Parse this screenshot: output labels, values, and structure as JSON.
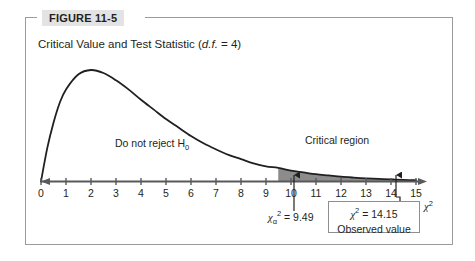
{
  "figure": {
    "tag_label": "FIGURE 11-5",
    "caption_prefix": "Critical Value and Test Statistic (",
    "caption_italic": "d.f.",
    "caption_suffix": " = 4)"
  },
  "labels": {
    "do_not_reject": "Do not reject H",
    "do_not_reject_sub": "0",
    "critical_region": "Critical region",
    "axis_title_base": "χ",
    "axis_title_sup": "2",
    "critical_value_base": "χ",
    "critical_value_sub": "α",
    "critical_value_sup": "2",
    "critical_value_text": " = 9.49",
    "observed_base": "χ",
    "observed_sup": "2",
    "observed_text": " = 14.15",
    "observed_caption": "Observed value"
  },
  "colors": {
    "curve": "#231f20",
    "axis": "#58595b",
    "shade_fill": "#8c8c8c",
    "frame": "#9b9b9b",
    "tag_bg": "#e3e3e3",
    "text": "#231f20",
    "box_border": "#8e8e8e"
  },
  "chart_data": {
    "type": "area",
    "title": "Critical Value and Test Statistic (d.f. = 4)",
    "xlabel": "χ²",
    "ylabel": "",
    "xlim": [
      0,
      15
    ],
    "ylim": [
      0,
      1
    ],
    "grid": false,
    "legend": "none",
    "distribution": "chi-square",
    "degrees_of_freedom": 4,
    "tick_labels": [
      "0",
      "1",
      "2",
      "3",
      "4",
      "5",
      "6",
      "7",
      "8",
      "9",
      "10",
      "11",
      "12",
      "13",
      "14",
      "15"
    ],
    "x": [
      0,
      0.25,
      0.5,
      0.75,
      1,
      1.5,
      2,
      2.5,
      3,
      3.5,
      4,
      4.5,
      5,
      5.5,
      6,
      6.5,
      7,
      7.5,
      8,
      8.5,
      9,
      9.49,
      10,
      10.5,
      11,
      11.5,
      12,
      12.5,
      13,
      13.5,
      14,
      14.15,
      14.5,
      15
    ],
    "y": [
      0,
      0.055,
      0.097,
      0.13,
      0.152,
      0.177,
      0.184,
      0.179,
      0.167,
      0.152,
      0.135,
      0.119,
      0.103,
      0.089,
      0.075,
      0.063,
      0.053,
      0.044,
      0.037,
      0.03,
      0.025,
      0.0225,
      0.018,
      0.015,
      0.012,
      0.01,
      0.008,
      0.0065,
      0.0052,
      0.0042,
      0.0034,
      0.0032,
      0.0027,
      0.0021
    ],
    "annotations": [
      {
        "name": "critical-value",
        "x": 9.49,
        "label": "χ²α = 9.49",
        "type": "up-arrow-with-label"
      },
      {
        "name": "observed-value",
        "x": 14.15,
        "label": "χ² = 14.15 / Observed value",
        "type": "up-arrow-with-boxed-label"
      },
      {
        "name": "do-not-reject-region",
        "label": "Do not reject H0",
        "x_range": [
          0,
          9.49
        ]
      },
      {
        "name": "critical-region",
        "label": "Critical region",
        "x_range": [
          9.49,
          15
        ],
        "shaded": true
      }
    ],
    "shaded_region": {
      "from": 9.49,
      "to": 15,
      "color": "#8c8c8c"
    }
  }
}
